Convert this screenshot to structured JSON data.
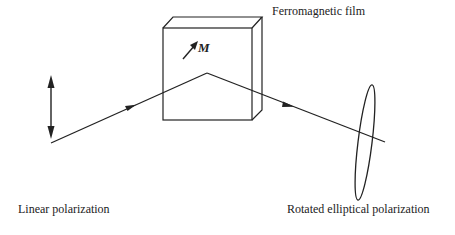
{
  "diagram": {
    "type": "optics-schematic",
    "labels": {
      "film": "Ferromagnetic film",
      "magnetization": "M",
      "input": "Linear polarization",
      "output": "Rotated elliptical polarization"
    },
    "elements": [
      {
        "id": "linear-polarization",
        "kind": "double-arrow",
        "orientation": "vertical"
      },
      {
        "id": "incident-beam",
        "kind": "ray-with-arrow"
      },
      {
        "id": "ferromagnetic-film",
        "kind": "3d-slab"
      },
      {
        "id": "magnetization-vector",
        "kind": "arrow",
        "label": "M"
      },
      {
        "id": "reflected-beam",
        "kind": "ray-with-arrow"
      },
      {
        "id": "elliptical-polarization",
        "kind": "tilted-ellipse"
      }
    ],
    "colors": {
      "stroke": "#222222",
      "background": "#ffffff"
    }
  }
}
